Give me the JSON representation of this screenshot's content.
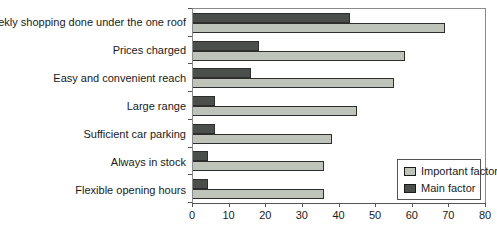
{
  "chart": {
    "x_ticks": [
      "0",
      "10",
      "20",
      "30",
      "40",
      "50",
      "60",
      "70",
      "80"
    ],
    "legend": {
      "items": [
        {
          "label": "Important factor",
          "color": "#bfc4bb"
        },
        {
          "label": "Main factor",
          "color": "#4a4f4b"
        }
      ]
    }
  },
  "chart_data": {
    "type": "bar",
    "orientation": "horizontal",
    "title": "",
    "xlabel": "",
    "ylabel": "",
    "xlim": [
      0,
      80
    ],
    "x_tick_step": 10,
    "grid": false,
    "legend_position": "inside-bottom-right",
    "categories": [
      "Weekly shopping done under the one roof",
      "Prices charged",
      "Easy and convenient reach",
      "Large range",
      "Sufficient car parking",
      "Always in stock",
      "Flexible opening hours"
    ],
    "series": [
      {
        "name": "Main factor",
        "color": "#4a4f4b",
        "values": [
          43,
          18,
          16,
          6,
          6,
          4,
          4
        ]
      },
      {
        "name": "Important factor",
        "color": "#bfc4bb",
        "values": [
          69,
          58,
          55,
          45,
          38,
          36,
          36
        ]
      }
    ]
  }
}
